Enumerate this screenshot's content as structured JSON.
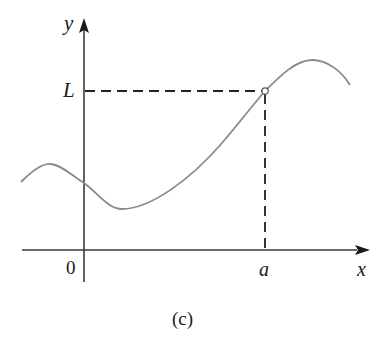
{
  "figure": {
    "caption": "(c)",
    "axes": {
      "x_label": "x",
      "y_label": "y",
      "origin_label": "0"
    },
    "marked_points": {
      "x_tick_label": "a",
      "y_tick_label": "L",
      "point": {
        "x": "a",
        "y": "L",
        "style": "open-circle"
      }
    },
    "guides": [
      {
        "type": "dashed-horizontal",
        "from": "y-axis",
        "to": "point",
        "at": "L"
      },
      {
        "type": "dashed-vertical",
        "from": "x-axis",
        "to": "point",
        "at": "a"
      }
    ],
    "colors": {
      "axis": "#3a3a3a",
      "curve": "#8a8a8a",
      "dashes": "#222222",
      "background": "#ffffff"
    }
  }
}
